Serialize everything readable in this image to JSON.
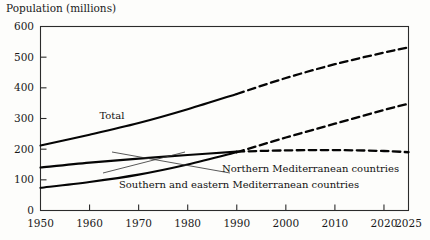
{
  "chart_data": {
    "type": "line",
    "title": "Population (millions)",
    "ylabel": "Population (millions)",
    "xlabel": "",
    "xlim": [
      1950,
      2025
    ],
    "ylim": [
      0,
      600
    ],
    "grid": false,
    "legend_position": "inline-annotations",
    "xticks": [
      1950,
      1960,
      1970,
      1980,
      1990,
      2000,
      2010,
      2020,
      2025
    ],
    "xtick_labels": [
      "1950",
      "1960",
      "1970",
      "1980",
      "1990",
      "2000",
      "2010",
      "2020",
      "2025"
    ],
    "yticks": [
      0,
      100,
      200,
      300,
      400,
      500,
      600
    ],
    "ytick_labels": [
      "0",
      "100",
      "200",
      "300",
      "400",
      "500",
      "600"
    ],
    "projection_start_year": 1990,
    "series": [
      {
        "name": "Total",
        "x": [
          1950,
          1960,
          1970,
          1980,
          1990,
          2000,
          2010,
          2020,
          2025
        ],
        "values": [
          212,
          247,
          285,
          330,
          380,
          432,
          477,
          515,
          532
        ],
        "style_solid_until": 1990
      },
      {
        "name": "Northern Mediterranean countries",
        "x": [
          1950,
          1960,
          1970,
          1980,
          1990,
          2000,
          2010,
          2020,
          2025
        ],
        "values": [
          140,
          156,
          169,
          181,
          192,
          196,
          197,
          194,
          190
        ],
        "style_solid_until": 1990
      },
      {
        "name": "Southern and eastern Mediterranean countries",
        "x": [
          1950,
          1960,
          1970,
          1980,
          1990,
          2000,
          2010,
          2020,
          2025
        ],
        "values": [
          74,
          93,
          117,
          150,
          190,
          238,
          283,
          328,
          348
        ],
        "style_solid_until": 1990
      }
    ],
    "annotations": [
      {
        "text": "Total",
        "x": 1962,
        "y": 300
      },
      {
        "text": "Northern Mediterranean countries",
        "x": 1987,
        "y": 125
      },
      {
        "text": "Southern and eastern Mediterranean countries",
        "x": 1966,
        "y": 72
      }
    ],
    "colors": {
      "line": "#050505",
      "frame": "#2b2b2b",
      "text": "#111111",
      "background": "#fdfdfb"
    }
  }
}
